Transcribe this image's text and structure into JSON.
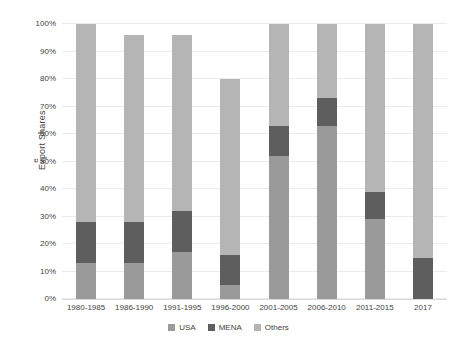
{
  "chart_data": {
    "type": "bar",
    "stacked": true,
    "title": "",
    "ylabel": "Export Shares",
    "ylabel_sub": "e",
    "xlabel": "",
    "categories": [
      "1980-1985",
      "1986-1990",
      "1991-1995",
      "1996-2000",
      "2001-2005",
      "2006-2010",
      "2011-2015",
      "2017"
    ],
    "series": [
      {
        "name": "USA",
        "color": "#9a9a9a",
        "values": [
          13,
          13,
          17,
          5,
          52,
          63,
          29,
          0
        ]
      },
      {
        "name": "MENA",
        "color": "#5e5e5e",
        "values": [
          15,
          15,
          15,
          11,
          11,
          10,
          10,
          15
        ]
      },
      {
        "name": "Others",
        "color": "#b5b5b5",
        "values": [
          72,
          68,
          64,
          64,
          37,
          27,
          61,
          85
        ]
      }
    ],
    "bar_totals": [
      100,
      96,
      96,
      80,
      100,
      100,
      100,
      100
    ],
    "y_ticks": [
      "0%",
      "10%",
      "20%",
      "30%",
      "40%",
      "50%",
      "60%",
      "70%",
      "80%",
      "90%",
      "100%"
    ],
    "ylim": [
      0,
      100
    ],
    "grid": true,
    "grid_color": "#ebebeb",
    "legend_position": "bottom",
    "legend": [
      "USA",
      "MENA",
      "Others"
    ]
  }
}
